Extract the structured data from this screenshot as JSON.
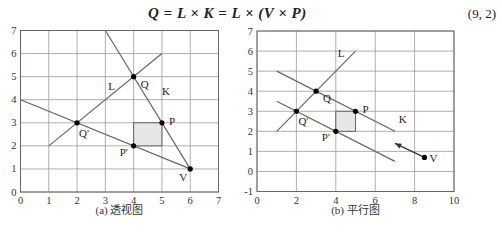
{
  "equation": {
    "text": "Q = L × K = L × (V × P)",
    "number": "(9, 2)"
  },
  "chart_data": [
    {
      "type": "line",
      "title": "(a) 透视图",
      "xlim": [
        0,
        7
      ],
      "ylim": [
        0,
        7
      ],
      "xticks": [
        0,
        1,
        2,
        3,
        4,
        5,
        6,
        7
      ],
      "yticks": [
        0,
        1,
        2,
        3,
        4,
        5,
        6,
        7
      ],
      "grid": true,
      "lines": [
        {
          "name": "L",
          "points": [
            [
              1,
              2
            ],
            [
              5,
              6
            ]
          ]
        },
        {
          "name": "K",
          "points": [
            [
              3,
              7
            ],
            [
              6,
              1
            ]
          ]
        },
        {
          "name": "V-P'-Q' line",
          "points": [
            [
              0,
              4
            ],
            [
              6,
              1
            ]
          ]
        }
      ],
      "points": [
        {
          "label": "Q",
          "x": 4,
          "y": 5
        },
        {
          "label": "P",
          "x": 5,
          "y": 3
        },
        {
          "label": "Q'",
          "x": 2,
          "y": 3
        },
        {
          "label": "P'",
          "x": 4,
          "y": 2
        },
        {
          "label": "V",
          "x": 6,
          "y": 1
        }
      ],
      "shaded_rect": {
        "x0": 4,
        "y0": 2,
        "x1": 5,
        "y1": 3
      },
      "line_labels": [
        {
          "label": "L",
          "x": 3.1,
          "y": 4.4
        },
        {
          "label": "K",
          "x": 5.0,
          "y": 4.2
        }
      ]
    },
    {
      "type": "line",
      "title": "(b) 平行图",
      "xlim": [
        0,
        10
      ],
      "ylim": [
        -1,
        7
      ],
      "xticks": [
        0,
        2,
        4,
        6,
        8,
        10
      ],
      "yticks": [
        -1,
        0,
        1,
        2,
        3,
        4,
        5,
        6,
        7
      ],
      "grid": true,
      "lines": [
        {
          "name": "L",
          "points": [
            [
              1,
              2
            ],
            [
              5,
              6
            ]
          ]
        },
        {
          "name": "K",
          "points": [
            [
              1,
              5
            ],
            [
              7,
              2
            ]
          ]
        },
        {
          "name": "P'-Q' line",
          "points": [
            [
              1,
              3.5
            ],
            [
              7,
              0.5
            ]
          ]
        }
      ],
      "arrow": {
        "from": [
          8.5,
          0.7
        ],
        "to": [
          7,
          1.4
        ],
        "label": "V"
      },
      "points": [
        {
          "label": "Q",
          "x": 3,
          "y": 4
        },
        {
          "label": "P",
          "x": 5,
          "y": 3
        },
        {
          "label": "Q'",
          "x": 2,
          "y": 3
        },
        {
          "label": "P'",
          "x": 4,
          "y": 2
        },
        {
          "label": "V",
          "x": 8.5,
          "y": 0.7
        }
      ],
      "shaded_rect": {
        "x0": 4,
        "y0": 2,
        "x1": 5,
        "y1": 3
      },
      "line_labels": [
        {
          "label": "L",
          "x": 4.1,
          "y": 5.7
        },
        {
          "label": "K",
          "x": 7.2,
          "y": 2.4
        }
      ]
    }
  ]
}
